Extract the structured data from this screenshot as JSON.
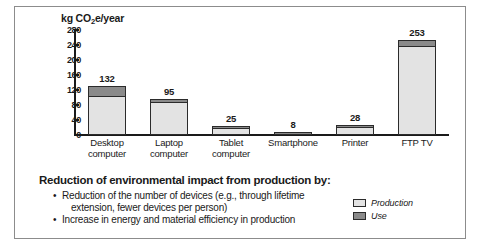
{
  "chart_data": {
    "type": "bar",
    "title": "",
    "subtitle": "",
    "xlabel": "",
    "ylabel": "kg CO2e/year",
    "ylabel_parts": {
      "prefix": "kg CO",
      "sub": "2",
      "suffix": "e/year"
    },
    "ylim": [
      0,
      280
    ],
    "yticks": [
      280,
      240,
      200,
      160,
      120,
      80,
      40,
      0
    ],
    "grid": false,
    "stacked": true,
    "legend_position": "bottom-right",
    "categories": [
      "Desktop computer",
      "Laptop computer",
      "Tablet computer",
      "Smartphone",
      "Printer",
      "FTP TV"
    ],
    "category_lines": [
      [
        "Desktop",
        "computer"
      ],
      [
        "Laptop",
        "computer"
      ],
      [
        "Tablet",
        "computer"
      ],
      [
        "Smartphone",
        ""
      ],
      [
        "Printer",
        ""
      ],
      [
        "FTP TV",
        ""
      ]
    ],
    "totals": [
      132,
      95,
      25,
      8,
      28,
      253
    ],
    "series": [
      {
        "name": "Production",
        "color": "#e3e3e3",
        "values": [
          104,
          88,
          21,
          7,
          22,
          238
        ]
      },
      {
        "name": "Use",
        "color": "#8a8a8a",
        "values": [
          28,
          7,
          4,
          1,
          6,
          15
        ]
      }
    ],
    "data_labels": [
      "132",
      "95",
      "25",
      "8",
      "28",
      "253"
    ],
    "legend": [
      {
        "label": "Production",
        "color": "#e3e3e3"
      },
      {
        "label": "Use",
        "color": "#8a8a8a"
      }
    ]
  },
  "text_block": {
    "heading": "Reduction of environmental impact from production by:",
    "bullets": [
      {
        "line1": "Reduction of the number of devices (e.g., through lifetime",
        "line2": "extension, fewer devices per person)"
      },
      {
        "line1": "Increase in energy and material efficiency in production",
        "line2": ""
      }
    ]
  },
  "colors": {
    "production": "#e3e3e3",
    "use": "#8a8a8a",
    "outline": "#2b2b2b",
    "frame": "#8c8c8c",
    "text": "#1a1a1a"
  }
}
